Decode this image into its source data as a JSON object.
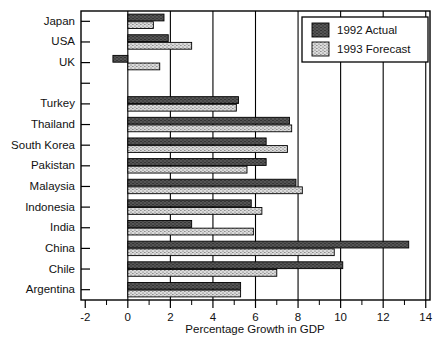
{
  "chart_data": {
    "type": "bar",
    "orientation": "horizontal",
    "title": "",
    "xlabel": "Percentage Growth in GDP",
    "ylabel": "",
    "xlim": [
      -2.2,
      14.2
    ],
    "xticks": [
      -2,
      0,
      2,
      4,
      6,
      8,
      10,
      12,
      14
    ],
    "xtick_labels": [
      "-2",
      "0",
      "2",
      "4",
      "6",
      "8",
      "10",
      "12",
      "14"
    ],
    "minor_xticks": [
      -1,
      1,
      3,
      5,
      7,
      9,
      11,
      13
    ],
    "grid": "vertical gridlines at even x values from 0 to 14",
    "legend_position": "top-right inside plot",
    "categories": [
      "Japan",
      "USA",
      "UK",
      "",
      "Turkey",
      "Thailand",
      "South Korea",
      "Pakistan",
      "Malaysia",
      "Indonesia",
      "India",
      "China",
      "Chile",
      "Argentina"
    ],
    "series": [
      {
        "name": "1992 Actual",
        "color": "#5a5a5a",
        "pattern": "dark-hatched",
        "values": [
          1.7,
          1.9,
          -0.7,
          null,
          5.2,
          7.6,
          6.5,
          6.5,
          7.9,
          5.8,
          3.0,
          13.2,
          10.1,
          5.3
        ]
      },
      {
        "name": "1993 Forecast",
        "color": "#d0d0d0",
        "pattern": "light-dotted",
        "values": [
          1.2,
          3.0,
          1.5,
          null,
          5.1,
          7.7,
          7.5,
          5.6,
          8.2,
          6.3,
          5.9,
          9.7,
          7.0,
          5.3
        ]
      }
    ]
  },
  "legend": {
    "entries": [
      {
        "label": "1992 Actual"
      },
      {
        "label": "1993 Forecast"
      }
    ]
  },
  "axis": {
    "x_title": "Percentage Growth in GDP"
  }
}
